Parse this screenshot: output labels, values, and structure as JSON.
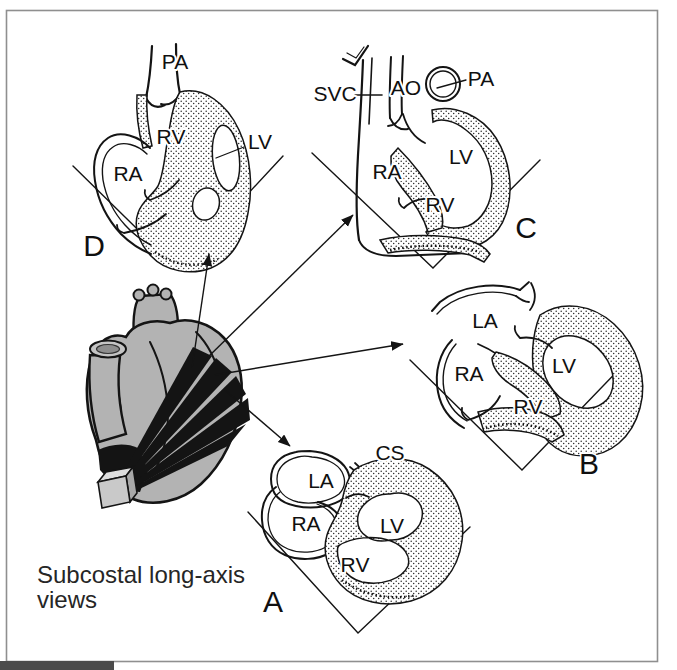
{
  "figure_caption": {
    "line1": "Subcostal long-axis",
    "line2": "views"
  },
  "views": {
    "D": {
      "letter": "D",
      "labels": {
        "pa": "PA",
        "rv": "RV",
        "lv": "LV",
        "ra": "RA"
      }
    },
    "C": {
      "letter": "C",
      "labels": {
        "svc": "SVC",
        "ao": "AO",
        "pa": "PA",
        "ra": "RA",
        "lv": "LV",
        "rv": "RV"
      }
    },
    "B": {
      "letter": "B",
      "labels": {
        "la": "LA",
        "ra": "RA",
        "lv": "LV",
        "rv": "RV"
      }
    },
    "A": {
      "letter": "A",
      "labels": {
        "cs": "CS",
        "la": "LA",
        "ra": "RA",
        "lv": "LV",
        "rv": "RV"
      }
    }
  },
  "colors": {
    "background": "#ffffff",
    "ink": "#141414",
    "heart_gray": "#b3b3b3",
    "frame": "#8f8f8f",
    "bottom_bar": "#4b4b4b"
  }
}
